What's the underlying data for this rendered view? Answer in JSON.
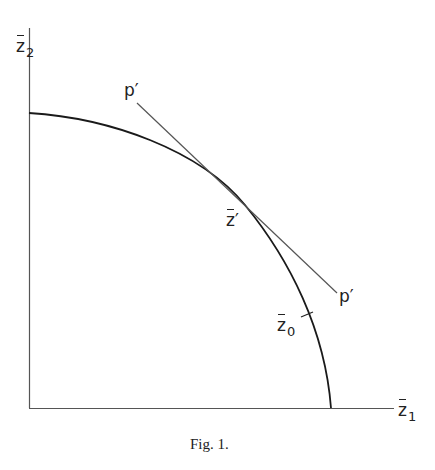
{
  "figure": {
    "caption": "Fig. 1.",
    "axes": {
      "x_label": "z",
      "x_sub": "1",
      "y_label": "z",
      "y_sub": "2"
    },
    "points": {
      "tangent_point_label": "z",
      "tangent_point_prime": "′",
      "z0_label": "z",
      "z0_sub": "0",
      "p_upper_label": "p′",
      "p_lower_label": "p′"
    },
    "colors": {
      "curve": "#1a1a1a",
      "tangent": "#555555",
      "axis": "#444444"
    }
  }
}
